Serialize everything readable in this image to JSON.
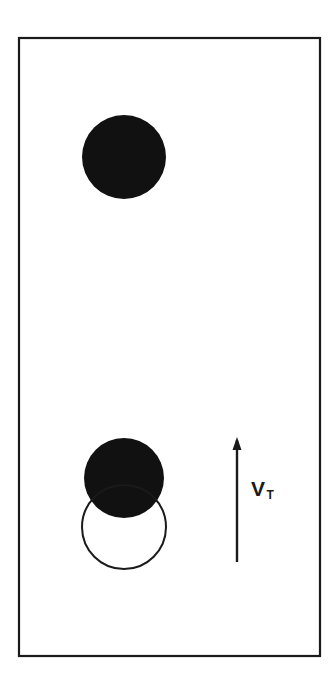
{
  "figure": {
    "background_color": "#ffffff",
    "stroke_color": "#1a1a1a",
    "fill_color": "#111111",
    "frame": {
      "x": 19,
      "y": 38,
      "width": 301,
      "height": 618,
      "stroke_width": 2.2
    },
    "shapes": [
      {
        "name": "upper-filled-bubble",
        "type": "circle",
        "cx": 124,
        "cy": 157,
        "r": 42,
        "fill": "#111111",
        "stroke": "none"
      },
      {
        "name": "lower-filled-bubble",
        "type": "circle",
        "cx": 124,
        "cy": 478,
        "r": 40,
        "fill": "#111111",
        "stroke": "none"
      },
      {
        "name": "lower-outline-bubble",
        "type": "circle",
        "cx": 124,
        "cy": 527,
        "r": 42,
        "fill": "none",
        "stroke": "#1a1a1a",
        "stroke_width": 2
      }
    ],
    "arrow": {
      "name": "velocity-arrow",
      "x": 237,
      "y_tail": 562,
      "y_head": 437,
      "stroke_width": 2.4,
      "head_width": 9,
      "head_length": 13,
      "direction": "up"
    },
    "label": {
      "name": "velocity-label",
      "symbol": "V",
      "subscript": "T",
      "x": 251,
      "y": 478
    }
  }
}
